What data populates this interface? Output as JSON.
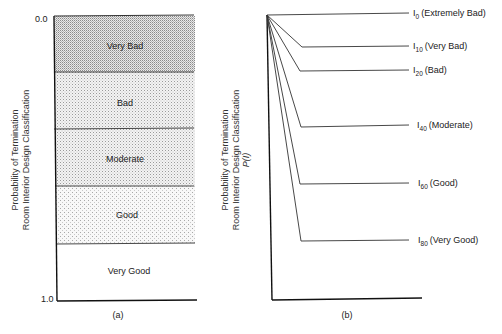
{
  "panel_a": {
    "caption": "(a)",
    "y_axis_title_line1": "Probability of Termination",
    "y_axis_title_line2": "Room Interior Design Classification",
    "y_tick_top": "0.0",
    "y_tick_bottom": "1.0",
    "bands": [
      {
        "label": "Very Bad",
        "shade": "dense"
      },
      {
        "label": "Bad",
        "shade": "medium"
      },
      {
        "label": "Moderate",
        "shade": "medium"
      },
      {
        "label": "Good",
        "shade": "light"
      },
      {
        "label": "Very Good",
        "shade": "none"
      }
    ]
  },
  "panel_b": {
    "caption": "(b)",
    "y_axis_title_line1": "Probability of Termination",
    "y_axis_title_line2": "Room Interior Design Classification",
    "y_axis_title_line3": "P(I)",
    "curves": [
      {
        "symbol": "I",
        "subscript": "0",
        "label": "(Extremely Bad)"
      },
      {
        "symbol": "I",
        "subscript": "10",
        "label": "(Very Bad)"
      },
      {
        "symbol": "I",
        "subscript": "20",
        "label": "(Bad)"
      },
      {
        "symbol": "I",
        "subscript": "40",
        "label": "(Moderate)"
      },
      {
        "symbol": "I",
        "subscript": "60",
        "label": "(Good)"
      },
      {
        "symbol": "I",
        "subscript": "80",
        "label": "(Very Good)"
      }
    ]
  }
}
